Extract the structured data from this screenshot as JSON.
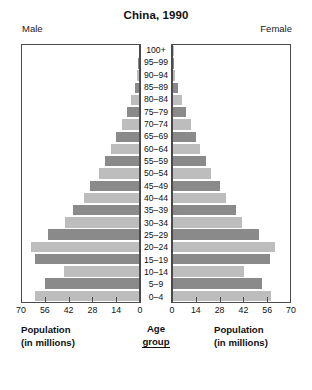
{
  "chart_data": {
    "type": "bar",
    "subtype": "population-pyramid",
    "title": "China, 1990",
    "xlabel": "Population (in millions)",
    "ylabel": "Age group",
    "grid": false,
    "legend": "none",
    "axis_ticks": [
      0,
      14,
      28,
      42,
      56,
      70
    ],
    "left_axis_ticks": [
      70,
      56,
      42,
      28,
      14,
      0
    ],
    "right_axis_ticks": [
      0,
      14,
      28,
      42,
      56,
      70
    ],
    "xlim": [
      0,
      70
    ],
    "categories": [
      "100+",
      "95–99",
      "90–94",
      "85–89",
      "80–84",
      "75–79",
      "70–74",
      "65–69",
      "60–64",
      "55–59",
      "50–54",
      "45–49",
      "40–44",
      "35–39",
      "30–34",
      "25–29",
      "20–24",
      "15–19",
      "10–14",
      "5–9",
      "0–4"
    ],
    "series": [
      {
        "name": "Male",
        "side": "left",
        "values": [
          0.1,
          0.4,
          1.1,
          2.6,
          4.5,
          7.0,
          10.0,
          13.5,
          16.5,
          20.5,
          24.0,
          29.5,
          33.0,
          39.5,
          44.0,
          54.5,
          64.5,
          62.0,
          45.0,
          56.5,
          62.5
        ]
      },
      {
        "name": "Female",
        "side": "right",
        "values": [
          0.1,
          0.5,
          1.4,
          3.2,
          5.3,
          7.8,
          10.6,
          13.8,
          16.3,
          19.8,
          23.0,
          28.0,
          31.5,
          37.5,
          41.5,
          51.5,
          61.0,
          58.0,
          42.5,
          53.0,
          58.5
        ]
      }
    ],
    "colors": {
      "bar_dark": "#8a8a8a",
      "bar_light": "#bdbdbd",
      "axis": "#4a4a4a",
      "text": "#111111",
      "background": "#ffffff"
    }
  },
  "header": {
    "male_label": "Male",
    "female_label": "Female"
  },
  "captions": {
    "population_line1": "Population",
    "population_line2": "(in millions)",
    "age_line1": "Age",
    "age_line2": "group"
  }
}
